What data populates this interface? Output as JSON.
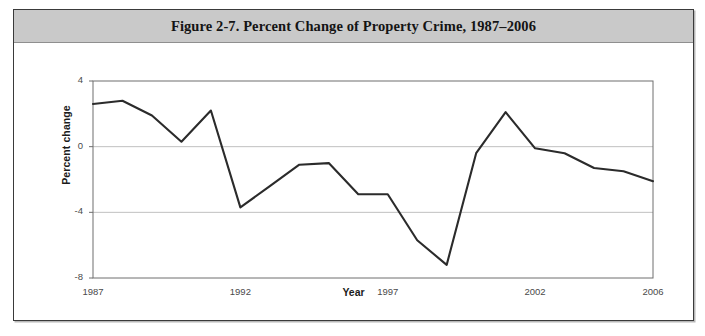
{
  "figure": {
    "title": "Figure 2-7. Percent Change of Property Crime, 1987–2006"
  },
  "chart_data": {
    "type": "line",
    "title": "Figure 2-7. Percent Change of Property Crime, 1987–2006",
    "xlabel": "Year",
    "ylabel": "Percent change",
    "xlim": [
      1987,
      2006
    ],
    "ylim": [
      -8,
      4
    ],
    "yticks": [
      4,
      0,
      -4,
      -8
    ],
    "ytick_labels": [
      "4",
      "0",
      "-4",
      "-8"
    ],
    "xticks": [
      1987,
      1992,
      1997,
      2002,
      2006
    ],
    "xtick_labels": [
      "1987",
      "1992",
      "1997",
      "2002",
      "2006"
    ],
    "grid": "horizontal",
    "legend": "none",
    "line_color": "#2b2b2b",
    "x": [
      1987,
      1988,
      1989,
      1990,
      1991,
      1992,
      1993,
      1994,
      1995,
      1996,
      1997,
      1998,
      1999,
      2000,
      2001,
      2002,
      2003,
      2004,
      2005,
      2006
    ],
    "values": [
      2.6,
      2.8,
      1.9,
      0.3,
      2.2,
      -3.7,
      -2.4,
      -1.1,
      -1.0,
      -2.9,
      -2.9,
      -5.7,
      -7.2,
      -0.4,
      2.1,
      -0.1,
      -0.4,
      -1.3,
      -1.5,
      -2.1
    ]
  },
  "colors": {
    "banner": "#c9c9c9",
    "line": "#2b2b2b",
    "grid": "#c0c0c0",
    "frame": "#6e6e6e"
  }
}
